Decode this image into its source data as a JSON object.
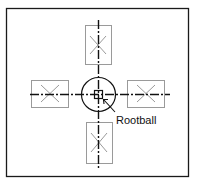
{
  "diagram": {
    "type": "planting-layout",
    "colors": {
      "frame": "#1a1a1a",
      "axis": "#111111",
      "box": "#9a9a9a",
      "cross": "#9a9a9a",
      "background": "#ffffff"
    },
    "frame": {
      "x": 6,
      "y": 8,
      "w": 183,
      "h": 169
    },
    "center": {
      "x": 98,
      "y": 94
    },
    "circle_radius": 17,
    "rootball_square": {
      "x": 94,
      "y": 90,
      "w": 8,
      "h": 8
    },
    "boxes": [
      {
        "name": "top",
        "x": 85,
        "y": 25,
        "w": 26,
        "h": 39
      },
      {
        "name": "left",
        "x": 31,
        "y": 80,
        "w": 38,
        "h": 27
      },
      {
        "name": "right",
        "x": 127,
        "y": 80,
        "w": 37,
        "h": 27
      },
      {
        "name": "bottom",
        "x": 86,
        "y": 122,
        "w": 26,
        "h": 41
      }
    ],
    "axes": {
      "vertical": {
        "x": 98,
        "y1": 20,
        "y2": 168
      },
      "horizontal": {
        "y": 94,
        "x1": 30,
        "x2": 170
      }
    },
    "callout": {
      "label": "Rootball",
      "text_x": 116,
      "text_y": 124,
      "arrow_from": {
        "x": 114,
        "y": 112
      },
      "arrow_to": {
        "x": 103,
        "y": 99
      }
    }
  }
}
